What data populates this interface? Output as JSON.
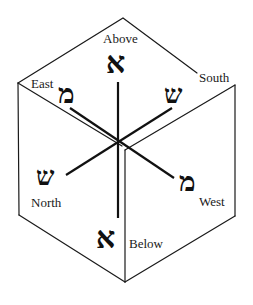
{
  "diagram": {
    "type": "cube-directions",
    "colors": {
      "line": "#1a1a1a",
      "background": "#ffffff"
    },
    "directions": {
      "above": {
        "label": "Above",
        "letter": "א",
        "letter_name": "Aleph"
      },
      "below": {
        "label": "Below",
        "letter": "א",
        "letter_name": "Aleph"
      },
      "east": {
        "label": "East",
        "letter": "מ",
        "letter_name": "Mem"
      },
      "west": {
        "label": "West",
        "letter": "מ",
        "letter_name": "Mem"
      },
      "south": {
        "label": "South",
        "letter": "ש",
        "letter_name": "Shin"
      },
      "north": {
        "label": "North",
        "letter": "ש",
        "letter_name": "Shin"
      }
    },
    "axes": [
      {
        "name": "vertical",
        "from": "above",
        "to": "below"
      },
      {
        "name": "east-west",
        "from": "east",
        "to": "west"
      },
      {
        "name": "south-north",
        "from": "south",
        "to": "north"
      }
    ]
  }
}
